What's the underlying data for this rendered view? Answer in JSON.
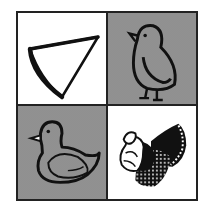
{
  "puzzle": {
    "layout": "2x2 grid",
    "cells": [
      {
        "position": "top-left",
        "background": "white",
        "figure": "cone-wedge-shape"
      },
      {
        "position": "top-right",
        "background": "gray",
        "figure": "chick"
      },
      {
        "position": "bottom-left",
        "background": "gray",
        "figure": "duck"
      },
      {
        "position": "bottom-right",
        "background": "white",
        "figure": "turkey"
      }
    ]
  },
  "colors": {
    "stroke": "#111111",
    "gray_fill": "#9a9a9a",
    "white_fill": "#ffffff",
    "border": "#222222"
  }
}
